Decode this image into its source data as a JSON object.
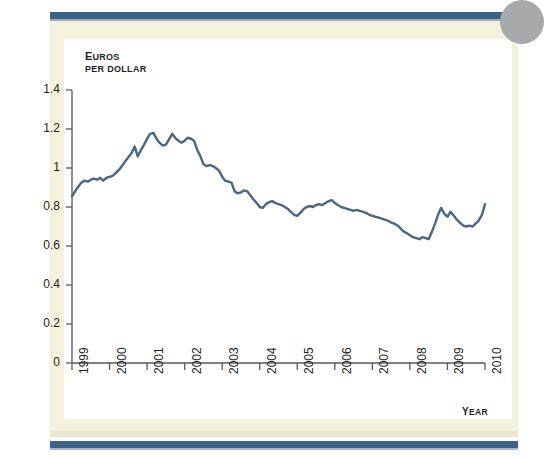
{
  "figure": {
    "panel_bg": "#ffffff",
    "page_bg": "#f4f2dc",
    "rule_color": "#3c6288",
    "line_color": "#4a6585",
    "axis_color": "#58595b"
  },
  "labels": {
    "y_axis_title_line1": "Euros",
    "y_axis_title_line1_small": "UROS",
    "y_axis_title_line1_cap": "E",
    "y_axis_title_line2": "PER DOLLAR",
    "x_axis_title_cap": "Y",
    "x_axis_title_small": "EAR",
    "x_axis_title": "Year"
  },
  "chart_data": {
    "type": "line",
    "title": "",
    "subtitle": "",
    "xlabel": "Year",
    "ylabel": "Euros per dollar",
    "xlim": [
      1999,
      2010
    ],
    "ylim": [
      0,
      1.4
    ],
    "ytick_labels": [
      "1.4",
      "1.2",
      "1",
      "0.8",
      "0.6",
      "0.4",
      "0.2",
      "0"
    ],
    "ytick_values": [
      1.4,
      1.2,
      1.0,
      0.8,
      0.6,
      0.4,
      0.2,
      0
    ],
    "xtick_labels": [
      "1999",
      "2000",
      "2001",
      "2002",
      "2003",
      "2004",
      "2005",
      "2006",
      "2007",
      "2008",
      "2009",
      "2010"
    ],
    "xtick_values": [
      1999,
      2000,
      2001,
      2002,
      2003,
      2004,
      2005,
      2006,
      2007,
      2008,
      2009,
      2010
    ],
    "grid": false,
    "legend": null,
    "series": [
      {
        "name": "Euros per dollar",
        "color": "#4a6585",
        "x": [
          1999.0,
          1999.08,
          1999.17,
          1999.25,
          1999.33,
          1999.42,
          1999.5,
          1999.58,
          1999.67,
          1999.75,
          1999.83,
          1999.92,
          2000.0,
          2000.08,
          2000.17,
          2000.25,
          2000.33,
          2000.42,
          2000.5,
          2000.58,
          2000.67,
          2000.75,
          2000.83,
          2000.92,
          2001.0,
          2001.08,
          2001.17,
          2001.25,
          2001.33,
          2001.42,
          2001.5,
          2001.58,
          2001.67,
          2001.75,
          2001.83,
          2001.92,
          2002.0,
          2002.08,
          2002.17,
          2002.25,
          2002.33,
          2002.42,
          2002.5,
          2002.58,
          2002.67,
          2002.75,
          2002.83,
          2002.92,
          2003.0,
          2003.08,
          2003.17,
          2003.25,
          2003.33,
          2003.42,
          2003.5,
          2003.58,
          2003.67,
          2003.75,
          2003.83,
          2003.92,
          2004.0,
          2004.08,
          2004.17,
          2004.25,
          2004.33,
          2004.42,
          2004.5,
          2004.58,
          2004.67,
          2004.75,
          2004.83,
          2004.92,
          2005.0,
          2005.08,
          2005.17,
          2005.25,
          2005.33,
          2005.42,
          2005.5,
          2005.58,
          2005.67,
          2005.75,
          2005.83,
          2005.92,
          2006.0,
          2006.08,
          2006.17,
          2006.25,
          2006.33,
          2006.42,
          2006.5,
          2006.58,
          2006.67,
          2006.75,
          2006.83,
          2006.92,
          2007.0,
          2007.08,
          2007.17,
          2007.25,
          2007.33,
          2007.42,
          2007.5,
          2007.58,
          2007.67,
          2007.75,
          2007.83,
          2007.92,
          2008.0,
          2008.08,
          2008.17,
          2008.25,
          2008.33,
          2008.42,
          2008.5,
          2008.58,
          2008.67,
          2008.75,
          2008.83,
          2008.92,
          2009.0,
          2009.08,
          2009.17,
          2009.25,
          2009.33,
          2009.42,
          2009.5,
          2009.58,
          2009.67,
          2009.75,
          2009.83,
          2009.92,
          2010.0
        ],
        "y": [
          0.855,
          0.88,
          0.905,
          0.925,
          0.935,
          0.93,
          0.94,
          0.945,
          0.94,
          0.95,
          0.935,
          0.95,
          0.955,
          0.96,
          0.975,
          0.99,
          1.01,
          1.035,
          1.055,
          1.075,
          1.11,
          1.06,
          1.09,
          1.12,
          1.15,
          1.175,
          1.18,
          1.15,
          1.13,
          1.115,
          1.12,
          1.145,
          1.175,
          1.155,
          1.14,
          1.13,
          1.14,
          1.155,
          1.15,
          1.14,
          1.095,
          1.06,
          1.02,
          1.01,
          1.015,
          1.01,
          1.0,
          0.985,
          0.955,
          0.935,
          0.93,
          0.925,
          0.88,
          0.87,
          0.875,
          0.885,
          0.88,
          0.86,
          0.84,
          0.82,
          0.8,
          0.795,
          0.815,
          0.825,
          0.83,
          0.82,
          0.815,
          0.81,
          0.8,
          0.79,
          0.775,
          0.76,
          0.755,
          0.77,
          0.79,
          0.8,
          0.805,
          0.8,
          0.81,
          0.815,
          0.81,
          0.82,
          0.83,
          0.835,
          0.82,
          0.81,
          0.8,
          0.795,
          0.79,
          0.785,
          0.78,
          0.785,
          0.78,
          0.775,
          0.77,
          0.76,
          0.755,
          0.75,
          0.745,
          0.74,
          0.735,
          0.73,
          0.72,
          0.715,
          0.705,
          0.69,
          0.675,
          0.665,
          0.655,
          0.645,
          0.64,
          0.635,
          0.645,
          0.64,
          0.635,
          0.67,
          0.715,
          0.76,
          0.795,
          0.765,
          0.75,
          0.775,
          0.755,
          0.735,
          0.72,
          0.705,
          0.7,
          0.705,
          0.7,
          0.715,
          0.73,
          0.76,
          0.815
        ]
      }
    ]
  }
}
